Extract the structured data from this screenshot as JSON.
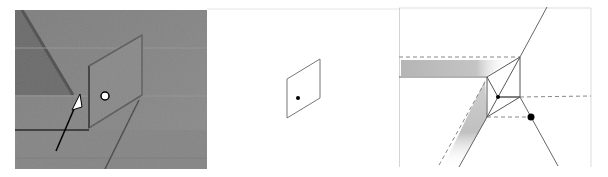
{
  "figure": {
    "panels": [
      {
        "id": "photo",
        "kind": "photograph",
        "description": "Folded paper photograph with arrow pointing to fold and white marker dot",
        "markers": [
          {
            "type": "dot",
            "fill": "#ffffff",
            "stroke": "#000000"
          },
          {
            "type": "arrow",
            "color": "#000000"
          }
        ],
        "colors": {
          "paper": "#8a8a8a",
          "paper_dark": "#5e5e5e",
          "crease": "#4a4a4a"
        }
      },
      {
        "id": "schematic",
        "kind": "line-drawing",
        "description": "Parallelogram outline with a black dot",
        "markers": [
          {
            "type": "dot",
            "fill": "#000000"
          }
        ],
        "colors": {
          "line": "#777777"
        }
      },
      {
        "id": "crease-pattern",
        "kind": "line-drawing",
        "description": "Crease pattern with shaded bands, dashed valley lines, and two black dots",
        "markers": [
          {
            "type": "dot-small",
            "fill": "#000000"
          },
          {
            "type": "dot-large",
            "fill": "#000000"
          }
        ],
        "colors": {
          "line": "#777777",
          "dashed": "#888888",
          "shade": "#b8b8b8",
          "border": "#d0d0d0"
        }
      }
    ]
  }
}
